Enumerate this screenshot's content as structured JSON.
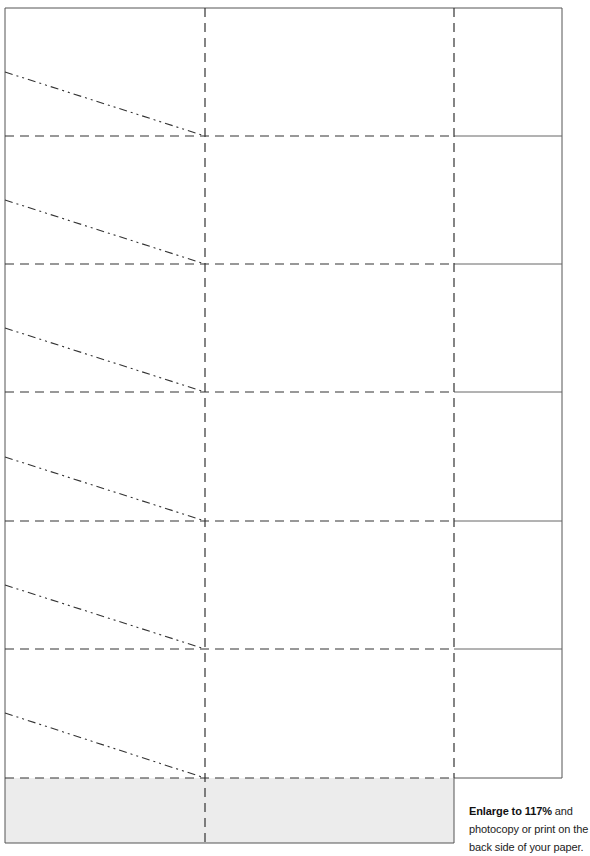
{
  "template": {
    "frame": {
      "left": 5,
      "top": 8,
      "main_right": 454,
      "panel_right": 562,
      "bottom": 843
    },
    "columns": {
      "fold_line_1_x": 205,
      "fold_line_2_x": 454
    },
    "rows": {
      "fold_lines_y": [
        136,
        264,
        392,
        521,
        649,
        778
      ],
      "panel_lines_y": [
        136,
        264,
        392,
        521,
        649
      ]
    },
    "diagonals": [
      {
        "x1": 5,
        "y1": 72,
        "x2": 205,
        "y2": 136
      },
      {
        "x1": 5,
        "y1": 200,
        "x2": 205,
        "y2": 264
      },
      {
        "x1": 5,
        "y1": 328,
        "x2": 205,
        "y2": 392
      },
      {
        "x1": 5,
        "y1": 457,
        "x2": 205,
        "y2": 521
      },
      {
        "x1": 5,
        "y1": 585,
        "x2": 205,
        "y2": 649
      },
      {
        "x1": 5,
        "y1": 713,
        "x2": 205,
        "y2": 778
      }
    ],
    "shaded_strip": {
      "y_top": 778,
      "y_bottom": 843,
      "color": "#ececec"
    },
    "line_color": "#333333",
    "frame_color": "#555555"
  },
  "note": {
    "bold": "Enlarge to 117%",
    "rest": " and photocopy or print on the back side of your paper."
  }
}
